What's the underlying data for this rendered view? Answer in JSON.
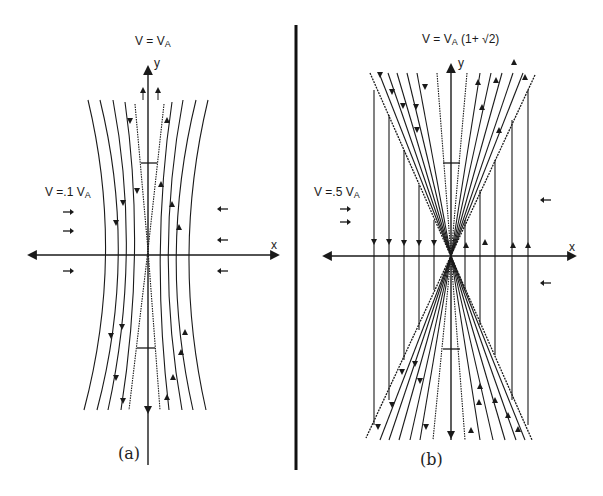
{
  "figure": {
    "panel_a": {
      "title_main": "V = V",
      "title_sub": "A",
      "side_label_main": "V =.1 V",
      "side_label_sub": "A",
      "x_axis_label": "x",
      "y_axis_label": "y",
      "caption": "(a)"
    },
    "panel_b": {
      "title_main": "V = V",
      "title_sub": "A",
      "title_suffix": " (1+ √2)",
      "side_label_main": "V =.5 V",
      "side_label_sub": "A",
      "x_axis_label": "x",
      "y_axis_label": "y",
      "caption": "(b)"
    },
    "line_color": "#1a1a1a",
    "background": "#ffffff"
  }
}
